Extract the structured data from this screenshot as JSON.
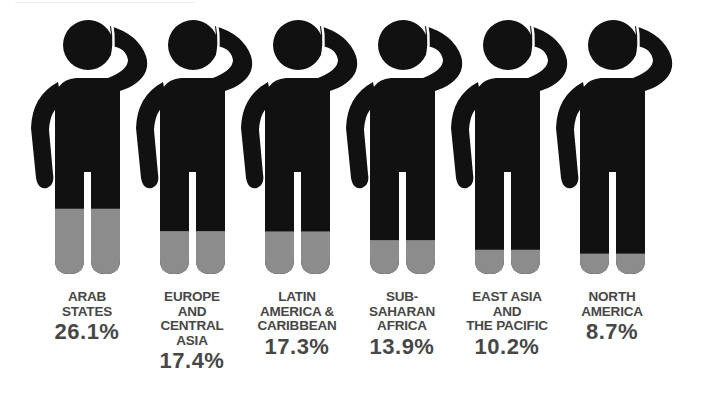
{
  "chart_data": {
    "type": "bar",
    "style": "pictogram (filled human figures, fill rises from feet)",
    "title": "",
    "categories": [
      "Arab States",
      "Europe and Central Asia",
      "Latin America & Caribbean",
      "Sub-Saharan Africa",
      "East Asia and the Pacific",
      "North America"
    ],
    "values": [
      26.1,
      17.4,
      17.3,
      13.9,
      10.2,
      8.7
    ],
    "unit": "%",
    "xlabel": "",
    "ylabel": "",
    "ylim": [
      0,
      100
    ],
    "grid": false,
    "legend": null
  },
  "colors": {
    "figure": "#111111",
    "fill": "#8c8c8c",
    "text": "#474747"
  },
  "figures": [
    {
      "name": "ARAB\nSTATES",
      "pct": "26.1%",
      "value": 26.1
    },
    {
      "name": "EUROPE\nAND\nCENTRAL\nASIA",
      "pct": "17.4%",
      "value": 17.4
    },
    {
      "name": "LATIN\nAMERICA &\nCARIBBEAN",
      "pct": "17.3%",
      "value": 17.3
    },
    {
      "name": "SUB-\nSAHARAN\nAFRICA",
      "pct": "13.9%",
      "value": 13.9
    },
    {
      "name": "EAST ASIA\nAND\nTHE PACIFIC",
      "pct": "10.2%",
      "value": 10.2
    },
    {
      "name": "NORTH\nAMERICA",
      "pct": "8.7%",
      "value": 8.7
    }
  ]
}
